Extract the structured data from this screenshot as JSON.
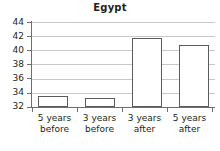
{
  "chart_data": {
    "type": "bar",
    "title": "Egypt",
    "xlabel": "",
    "ylabel": "",
    "categories": [
      "5 years before",
      "3 years before",
      "3 years after",
      "5 years after"
    ],
    "category_lines": [
      [
        "5 years",
        "before"
      ],
      [
        "3 years",
        "before"
      ],
      [
        "3 years",
        "after"
      ],
      [
        "5 years",
        "after"
      ]
    ],
    "values": [
      33.6,
      33.3,
      41.8,
      40.8
    ],
    "ylim": [
      32,
      44
    ],
    "yticks": [
      32,
      34,
      36,
      38,
      40,
      42,
      44
    ],
    "ytick_labels": [
      "32",
      "34",
      "36",
      "38",
      "40",
      "42",
      "44"
    ],
    "grid": true,
    "grid_axis": "y",
    "legend": false,
    "bar_fill": "#ffffff",
    "bar_edge": "#5c5c5c",
    "grid_color": "#c8c8c8",
    "axis_color": "#6f6f6f",
    "text_color": "#231f20",
    "background": "#ffffff"
  }
}
